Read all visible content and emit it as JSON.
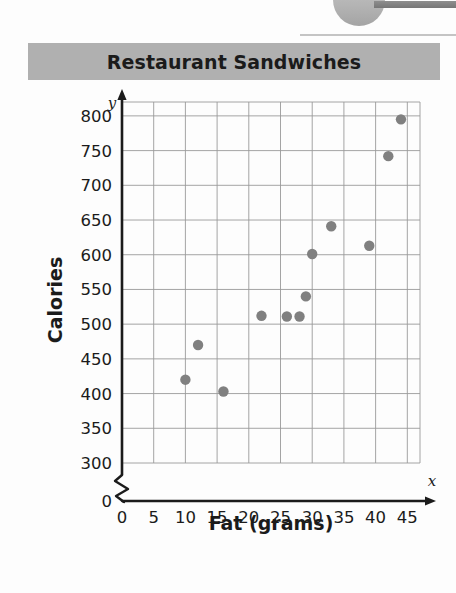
{
  "banner": {
    "title": "Restaurant Sandwiches"
  },
  "chart_data": {
    "type": "scatter",
    "title": "Restaurant Sandwiches",
    "xlabel": "Fat (grams)",
    "ylabel": "Calories",
    "x_axis_variable": "x",
    "y_axis_variable": "y",
    "xlim": [
      0,
      47
    ],
    "ylim": [
      300,
      820
    ],
    "y_axis_break": true,
    "y_break_label": "0",
    "grid": true,
    "legend": "none",
    "xticks": [
      0,
      5,
      10,
      15,
      20,
      25,
      30,
      35,
      40,
      45
    ],
    "xtick_labels": [
      "0",
      "5",
      "10",
      "15",
      "20",
      "25",
      "30",
      "35",
      "40",
      "45"
    ],
    "yticks": [
      300,
      350,
      400,
      450,
      500,
      550,
      600,
      650,
      700,
      750,
      800
    ],
    "ytick_labels": [
      "300",
      "350",
      "400",
      "450",
      "500",
      "550",
      "600",
      "650",
      "700",
      "750",
      "800"
    ],
    "point_color": "#808080",
    "points": [
      {
        "x": 10,
        "y": 420
      },
      {
        "x": 12,
        "y": 470
      },
      {
        "x": 16,
        "y": 403
      },
      {
        "x": 22,
        "y": 512
      },
      {
        "x": 26,
        "y": 511
      },
      {
        "x": 28,
        "y": 511
      },
      {
        "x": 29,
        "y": 540
      },
      {
        "x": 30,
        "y": 601
      },
      {
        "x": 33,
        "y": 641
      },
      {
        "x": 39,
        "y": 613
      },
      {
        "x": 42,
        "y": 742
      },
      {
        "x": 44,
        "y": 795
      }
    ]
  }
}
